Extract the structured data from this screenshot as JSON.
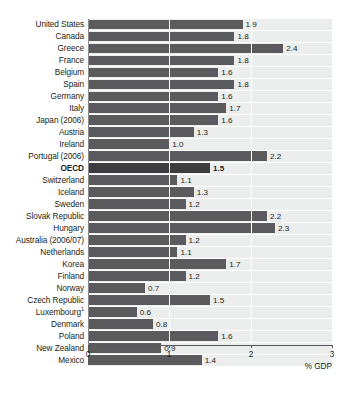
{
  "chart_data": {
    "type": "bar",
    "orientation": "horizontal",
    "title": "",
    "subtitle": "",
    "xlabel": "% GDP",
    "ylabel": "",
    "xlim": [
      0,
      3
    ],
    "xticks": [
      "0",
      "1",
      "2",
      "3"
    ],
    "xtick_values": [
      0,
      1,
      2,
      3
    ],
    "grid": true,
    "grid_axis": "x",
    "legend": "none",
    "value_labels": true,
    "highlight_category": "OECD",
    "footnote_marker": "1",
    "categories": [
      "United States",
      "Canada",
      "Greece",
      "France",
      "Belgium",
      "Spain",
      "Germany",
      "Italy",
      "Japan (2006)",
      "Austria",
      "Ireland",
      "Portugal (2006)",
      "OECD",
      "Switzerland",
      "Iceland",
      "Sweden",
      "Slovak Republic",
      "Hungary",
      "Australia (2006/07)",
      "Netherlands",
      "Korea",
      "Finland",
      "Norway",
      "Czech Republic",
      "Luxembourg",
      "Denmark",
      "Poland",
      "New Zealand",
      "Mexico"
    ],
    "values": [
      1.9,
      1.8,
      2.4,
      1.8,
      1.6,
      1.8,
      1.6,
      1.7,
      1.6,
      1.3,
      1.0,
      2.2,
      1.5,
      1.1,
      1.3,
      1.2,
      2.2,
      2.3,
      1.2,
      1.1,
      1.7,
      1.2,
      0.7,
      1.5,
      0.6,
      0.8,
      1.6,
      0.9,
      1.4
    ],
    "value_labels_text": [
      "1.9",
      "1.8",
      "2.4",
      "1.8",
      "1.6",
      "1.8",
      "1.6",
      "1.7",
      "1.6",
      "1.3",
      "1.0",
      "2.2",
      "1.5",
      "1.1",
      "1.3",
      "1.2",
      "2.2",
      "2.3",
      "1.2",
      "1.1",
      "1.7",
      "1.2",
      "0.7",
      "1.5",
      "0.6",
      "0.8",
      "1.6",
      "0.9",
      "1.4"
    ],
    "rows": [
      {
        "label": "United States",
        "value": 1.9,
        "value_label": "1.9",
        "highlight": false,
        "sup": ""
      },
      {
        "label": "Canada",
        "value": 1.8,
        "value_label": "1.8",
        "highlight": false,
        "sup": ""
      },
      {
        "label": "Greece",
        "value": 2.4,
        "value_label": "2.4",
        "highlight": false,
        "sup": ""
      },
      {
        "label": "France",
        "value": 1.8,
        "value_label": "1.8",
        "highlight": false,
        "sup": ""
      },
      {
        "label": "Belgium",
        "value": 1.6,
        "value_label": "1.6",
        "highlight": false,
        "sup": ""
      },
      {
        "label": "Spain",
        "value": 1.8,
        "value_label": "1.8",
        "highlight": false,
        "sup": ""
      },
      {
        "label": "Germany",
        "value": 1.6,
        "value_label": "1.6",
        "highlight": false,
        "sup": ""
      },
      {
        "label": "Italy",
        "value": 1.7,
        "value_label": "1.7",
        "highlight": false,
        "sup": ""
      },
      {
        "label": "Japan (2006)",
        "value": 1.6,
        "value_label": "1.6",
        "highlight": false,
        "sup": ""
      },
      {
        "label": "Austria",
        "value": 1.3,
        "value_label": "1.3",
        "highlight": false,
        "sup": ""
      },
      {
        "label": "Ireland",
        "value": 1.0,
        "value_label": "1.0",
        "highlight": false,
        "sup": ""
      },
      {
        "label": "Portugal (2006)",
        "value": 2.2,
        "value_label": "2.2",
        "highlight": false,
        "sup": ""
      },
      {
        "label": "OECD",
        "value": 1.5,
        "value_label": "1.5",
        "highlight": true,
        "sup": ""
      },
      {
        "label": "Switzerland",
        "value": 1.1,
        "value_label": "1.1",
        "highlight": false,
        "sup": ""
      },
      {
        "label": "Iceland",
        "value": 1.3,
        "value_label": "1.3",
        "highlight": false,
        "sup": ""
      },
      {
        "label": "Sweden",
        "value": 1.2,
        "value_label": "1.2",
        "highlight": false,
        "sup": ""
      },
      {
        "label": "Slovak Republic",
        "value": 2.2,
        "value_label": "2.2",
        "highlight": false,
        "sup": ""
      },
      {
        "label": "Hungary",
        "value": 2.3,
        "value_label": "2.3",
        "highlight": false,
        "sup": ""
      },
      {
        "label": "Australia (2006/07)",
        "value": 1.2,
        "value_label": "1.2",
        "highlight": false,
        "sup": ""
      },
      {
        "label": "Netherlands",
        "value": 1.1,
        "value_label": "1.1",
        "highlight": false,
        "sup": ""
      },
      {
        "label": "Korea",
        "value": 1.7,
        "value_label": "1.7",
        "highlight": false,
        "sup": ""
      },
      {
        "label": "Finland",
        "value": 1.2,
        "value_label": "1.2",
        "highlight": false,
        "sup": ""
      },
      {
        "label": "Norway",
        "value": 0.7,
        "value_label": "0.7",
        "highlight": false,
        "sup": ""
      },
      {
        "label": "Czech Republic",
        "value": 1.5,
        "value_label": "1.5",
        "highlight": false,
        "sup": ""
      },
      {
        "label": "Luxembourg",
        "value": 0.6,
        "value_label": "0.6",
        "highlight": false,
        "sup": "1"
      },
      {
        "label": "Denmark",
        "value": 0.8,
        "value_label": "0.8",
        "highlight": false,
        "sup": ""
      },
      {
        "label": "Poland",
        "value": 1.6,
        "value_label": "1.6",
        "highlight": false,
        "sup": ""
      },
      {
        "label": "New Zealand",
        "value": 0.9,
        "value_label": "0.9",
        "highlight": false,
        "sup": ""
      },
      {
        "label": "Mexico",
        "value": 1.4,
        "value_label": "1.4",
        "highlight": false,
        "sup": ""
      }
    ],
    "colors": {
      "bar": "#5b5b5d",
      "bar_highlight": "#3d3d3f",
      "band": "#eceded",
      "gridline": "#ffffff",
      "axis": "#58585a",
      "text": "#231f20",
      "background": "#ffffff"
    }
  }
}
